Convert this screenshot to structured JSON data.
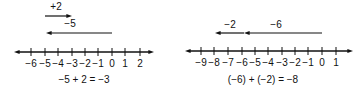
{
  "colors": {
    "ink": "#111111",
    "background": "#ffffff"
  },
  "diagrams": [
    {
      "id": "left",
      "number_line": {
        "y": 52,
        "x_start": 14,
        "x_end": 154,
        "ticks": [
          {
            "label": "-6",
            "x": 31
          },
          {
            "label": "-5",
            "x": 45
          },
          {
            "label": "-4",
            "x": 58
          },
          {
            "label": "-3",
            "x": 72
          },
          {
            "label": "-2",
            "x": 85
          },
          {
            "label": "-1",
            "x": 98
          },
          {
            "label": "0",
            "x": 112
          },
          {
            "label": "1",
            "x": 125
          },
          {
            "label": "2",
            "x": 140
          }
        ]
      },
      "arrows": [
        {
          "label": "+2",
          "from_x": 45,
          "to_x": 72,
          "y": 16,
          "label_x": 56,
          "label_y": 10
        },
        {
          "label": "-5",
          "from_x": 112,
          "to_x": 46,
          "y": 33,
          "label_x": 70,
          "label_y": 27
        }
      ],
      "equation": {
        "text": "−5 + 2 = −3",
        "x": 84,
        "y": 83
      }
    },
    {
      "id": "right",
      "number_line": {
        "y": 51,
        "x_start": 185,
        "x_end": 353,
        "ticks": [
          {
            "label": "-9",
            "x": 201
          },
          {
            "label": "-8",
            "x": 214
          },
          {
            "label": "-7",
            "x": 228
          },
          {
            "label": "-6",
            "x": 242
          },
          {
            "label": "-5",
            "x": 255
          },
          {
            "label": "-4",
            "x": 268
          },
          {
            "label": "-3",
            "x": 282
          },
          {
            "label": "-2",
            "x": 295
          },
          {
            "label": "-1",
            "x": 308
          },
          {
            "label": "0",
            "x": 322
          },
          {
            "label": "1",
            "x": 336
          }
        ]
      },
      "arrows": [
        {
          "label": "-6",
          "from_x": 322,
          "to_x": 244,
          "y": 33,
          "label_x": 276,
          "label_y": 28
        },
        {
          "label": "-2",
          "from_x": 244,
          "to_x": 215,
          "y": 33,
          "label_x": 230,
          "label_y": 28
        }
      ],
      "equation": {
        "text": "(−6) + (−2) = −8",
        "x": 263,
        "y": 83
      }
    }
  ]
}
